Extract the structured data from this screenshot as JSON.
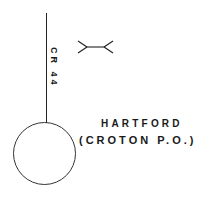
{
  "map": {
    "road": {
      "label": "CR 44"
    },
    "bridge_symbol": "bridge-icon",
    "place": {
      "name": "HARTFORD",
      "subtitle": "(CROTON P.O.)"
    },
    "colors": {
      "ink": "#1a1a1a",
      "background": "#ffffff"
    }
  }
}
